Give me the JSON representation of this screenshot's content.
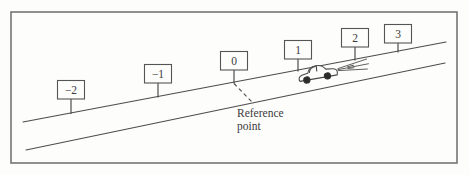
{
  "figure": {
    "type": "textbook-physics-diagram",
    "colors": {
      "background": "#fdfdfc",
      "line": "#4d4d4d",
      "text": "#3a3a3a",
      "frame": "#757575"
    },
    "signs": [
      {
        "label": "−2"
      },
      {
        "label": "−1"
      },
      {
        "label": "0"
      },
      {
        "label": "1"
      },
      {
        "label": "2"
      },
      {
        "label": "3"
      }
    ],
    "reference_label": {
      "line1": "Reference",
      "line2": "point"
    },
    "icons": {
      "car": "sedan-silhouette-facing-right",
      "headlights": "fanned-beam-lines"
    }
  }
}
